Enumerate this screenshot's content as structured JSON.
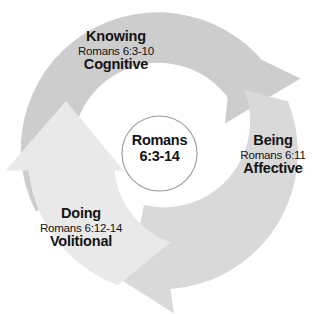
{
  "diagram": {
    "type": "cycle",
    "title_center": {
      "line1": "Romans",
      "line2": "6:3-14"
    },
    "colors": {
      "segment_dark": "#cdcdcd",
      "segment_medium": "#d9d9d9",
      "segment_light": "#e9e9e9",
      "text": "#141414",
      "center_outline": "#9a9a9a",
      "background": "#ffffff"
    },
    "stages": [
      {
        "id": "knowing",
        "title": "Knowing",
        "reference": "Romans 6:3-10",
        "domain": "Cognitive"
      },
      {
        "id": "being",
        "title": "Being",
        "reference": "Romans 6:11",
        "domain": "Affective"
      },
      {
        "id": "doing",
        "title": "Doing",
        "reference": "Romans 6:12-14",
        "domain": "Volitional"
      }
    ]
  }
}
